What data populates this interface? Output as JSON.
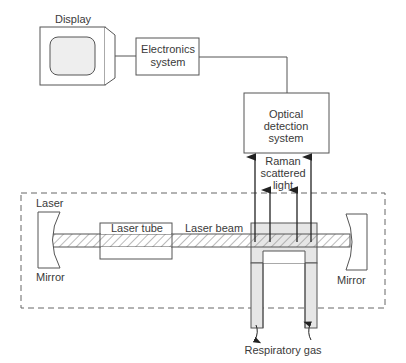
{
  "diagram": {
    "display_label": "Display",
    "electronics": {
      "line1": "Electronics",
      "line2": "system"
    },
    "optical": {
      "line1": "Optical",
      "line2": "detection",
      "line3": "system"
    },
    "raman": {
      "line1": "Raman",
      "line2": "scattered",
      "line3": "light"
    },
    "laser_mirror_left": {
      "top": "Laser",
      "bottom": "Mirror"
    },
    "mirror_right": "Mirror",
    "laser_tube": "Laser tube",
    "laser_beam": "Laser beam",
    "respiratory_gas": "Respiratory gas"
  },
  "colors": {
    "stroke": "#555555",
    "screen_fill": "#eeeeee",
    "gas_fill": "#e6e6e6",
    "text": "#3a3a3a"
  }
}
